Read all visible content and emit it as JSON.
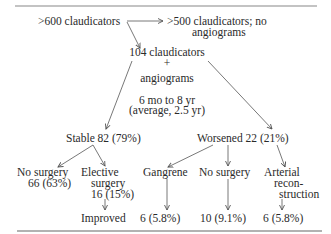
{
  "diagram": {
    "type": "flowchart",
    "nodes": {
      "total": ">600 claudicators",
      "excluded_line1": ">500 claudicators; no",
      "excluded_line2": "angiograms",
      "studied_line1": "104 claudicators",
      "studied_plus": "+",
      "studied_line2": "angiograms",
      "followup_line1": "6 mo to 8 yr",
      "followup_line2": "(average, 2.5 yr)",
      "stable": "Stable 82 (79%)",
      "worsened": "Worsened 22 (21%)",
      "stable_no_surgery_line1": "No surgery",
      "stable_no_surgery_line2": "66 (63%)",
      "elective_line1": "Elective",
      "elective_line2": "surgery",
      "elective_line3": "16 (15%)",
      "elective_outcome": "Improved",
      "gangrene": "Gangrene",
      "gangrene_outcome": "6 (5.8%)",
      "worsened_no_surgery": "No surgery",
      "worsened_no_surgery_outcome": "10 (9.1%)",
      "arterial_line1": "Arterial",
      "arterial_line2": "recon-",
      "arterial_line3": "struction",
      "arterial_outcome": "6 (5.8%)"
    },
    "edges": [
      {
        "from": ">600 claudicators",
        "to": ">500 claudicators; no angiograms"
      },
      {
        "from": ">600 claudicators",
        "to": "104 claudicators + angiograms"
      },
      {
        "from": "104 claudicators + angiograms",
        "to": "Stable 82 (79%)"
      },
      {
        "from": "104 claudicators + angiograms",
        "to": "Worsened 22 (21%)"
      },
      {
        "from": "Stable 82 (79%)",
        "to": "No surgery 66 (63%)"
      },
      {
        "from": "Stable 82 (79%)",
        "to": "Elective surgery 16 (15%)"
      },
      {
        "from": "Elective surgery 16 (15%)",
        "to": "Improved"
      },
      {
        "from": "Worsened 22 (21%)",
        "to": "Gangrene"
      },
      {
        "from": "Worsened 22 (21%)",
        "to": "No surgery"
      },
      {
        "from": "Worsened 22 (21%)",
        "to": "Arterial reconstruction"
      },
      {
        "from": "Gangrene",
        "to": "6 (5.8%)"
      },
      {
        "from": "No surgery",
        "to": "10 (9.1%)"
      },
      {
        "from": "Arterial reconstruction",
        "to": "6 (5.8%)"
      }
    ]
  },
  "colors": {
    "ink": "#2a2a2a",
    "line": "#555555",
    "rule": "#888888",
    "background": "#ffffff"
  }
}
